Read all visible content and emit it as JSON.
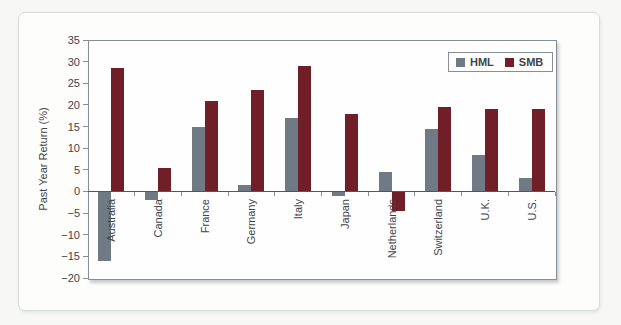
{
  "figure": {
    "kind": "scanned textbook bar chart",
    "background": "#f7f8f6",
    "card_background": "#fdfdfc",
    "card_border_color": "#d6dcd4"
  },
  "chart_data": {
    "type": "bar",
    "title": "",
    "xlabel": "",
    "ylabel": "Past Year Return (%)",
    "categories": [
      "Australia",
      "Canada",
      "France",
      "Germany",
      "Italy",
      "Japan",
      "Netherlands",
      "Switzerland",
      "U.K.",
      "U.S."
    ],
    "series": [
      {
        "name": "HML",
        "color": "#6f7a84",
        "values": [
          -16,
          -2,
          15,
          1.5,
          17,
          -1,
          4.5,
          14.5,
          8.5,
          3
        ]
      },
      {
        "name": "SMB",
        "color": "#701f28",
        "values": [
          28.5,
          5.5,
          21,
          23.5,
          29,
          18,
          -4.5,
          19.5,
          19,
          19
        ]
      }
    ],
    "ylim": [
      -20,
      35
    ],
    "ytick_step": 5,
    "ytick_labels": [
      "35",
      "30",
      "25",
      "20",
      "15",
      "10",
      "5",
      "0",
      "−5",
      "−10",
      "−15",
      "−20"
    ],
    "grid": false,
    "legend_position": "top-right",
    "axis_color": "#878e96",
    "zero_line_color": "#51575e",
    "text_color": "#3d444b",
    "x_labels_rotated_degrees": -90
  }
}
